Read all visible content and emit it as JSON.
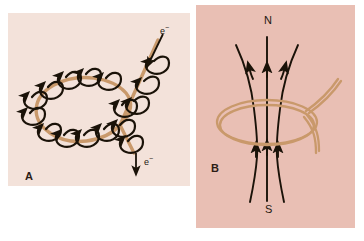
{
  "figure": {
    "name": "magnetic-field-of-current-loop",
    "background": "#ffffff"
  },
  "panels": [
    {
      "id": "A",
      "label": "A",
      "background": "#f3e2da",
      "description": "Circular current loop with circular magnetic field lines encircling the wire",
      "wire_color": "#c9996b",
      "field_color": "#1a1208",
      "annotations": [
        {
          "name": "electron-flow-in",
          "text": "e",
          "superscript": "−"
        },
        {
          "name": "electron-flow-out",
          "text": "e",
          "superscript": "−"
        }
      ]
    },
    {
      "id": "B",
      "label": "B",
      "background": "#e9bfb4",
      "description": "Same current loop showing resultant dipole field lines through the coil axis",
      "wire_color": "#c9996b",
      "field_color": "#1a1208",
      "poles": [
        {
          "name": "north-pole-label",
          "text": "N"
        },
        {
          "name": "south-pole-label",
          "text": "S"
        }
      ]
    }
  ]
}
